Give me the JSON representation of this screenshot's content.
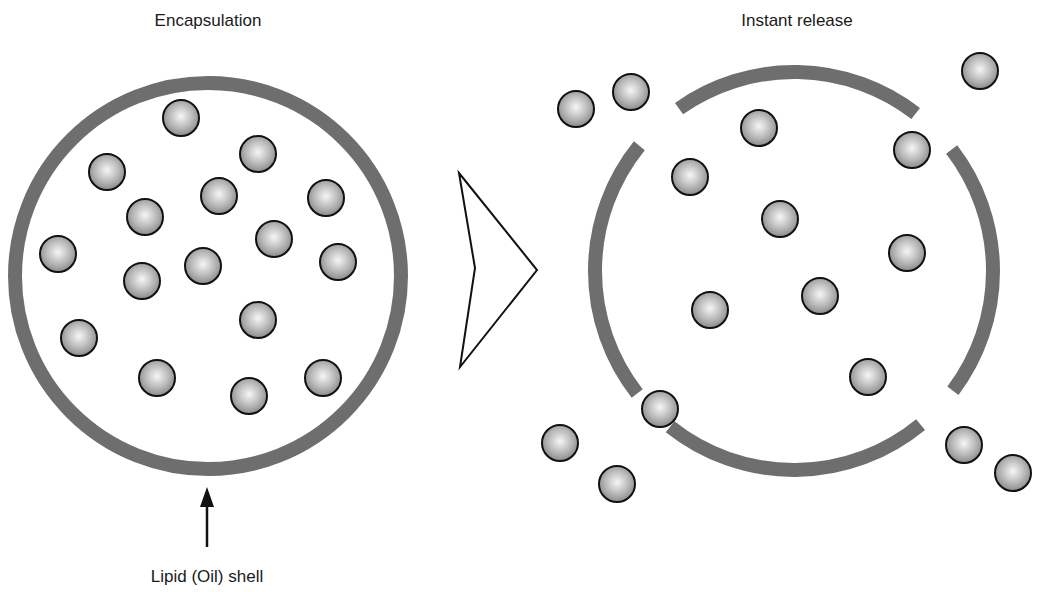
{
  "diagram": {
    "left_panel": {
      "title": "Encapsulation",
      "shell_label": "Lipid (Oil) shell",
      "shell": {
        "cx": 208,
        "cy": 276,
        "r": 193
      },
      "particles": [
        [
          181,
          118
        ],
        [
          258,
          154
        ],
        [
          107,
          172
        ],
        [
          326,
          198
        ],
        [
          219,
          196
        ],
        [
          145,
          217
        ],
        [
          274,
          239
        ],
        [
          58,
          254
        ],
        [
          338,
          262
        ],
        [
          203,
          266
        ],
        [
          142,
          281
        ],
        [
          258,
          320
        ],
        [
          79,
          338
        ],
        [
          157,
          378
        ],
        [
          249,
          396
        ],
        [
          323,
          378
        ]
      ]
    },
    "transition_arrow": {
      "points": [
        [
          459,
          173
        ],
        [
          537,
          270
        ],
        [
          460,
          367
        ],
        [
          475,
          268
        ]
      ]
    },
    "right_panel": {
      "title": "Instant release",
      "shell": {
        "cx": 794,
        "cy": 271,
        "r": 199
      },
      "arc_segments_deg": [
        [
          234.7,
          307.7
        ],
        [
          322.4,
          397
        ],
        [
          50.5,
          128.5
        ],
        [
          142,
          219
        ]
      ],
      "particles": [
        [
          576,
          109
        ],
        [
          631,
          92
        ],
        [
          759,
          128
        ],
        [
          980,
          71
        ],
        [
          912,
          150
        ],
        [
          690,
          177
        ],
        [
          780,
          219
        ],
        [
          907,
          253
        ],
        [
          820,
          296
        ],
        [
          710,
          310
        ],
        [
          868,
          377
        ],
        [
          660,
          409
        ],
        [
          560,
          443
        ],
        [
          617,
          484
        ],
        [
          964,
          445
        ],
        [
          1013,
          473
        ]
      ]
    },
    "particle_radius": 18,
    "colors": {
      "shell": "#6e6e6e",
      "particle_outline": "#111111",
      "particle_fill_light": "#f4f4f4",
      "particle_fill_dark": "#8a8a8a"
    }
  }
}
